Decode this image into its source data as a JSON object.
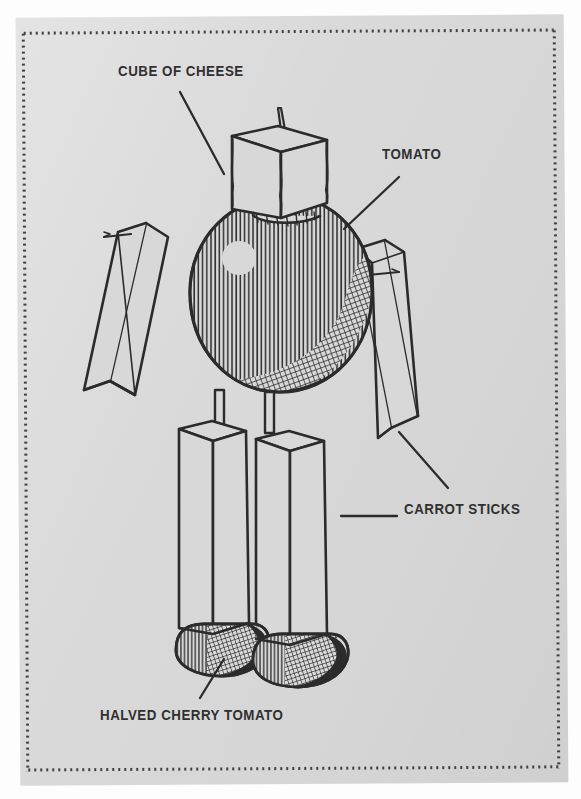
{
  "document": {
    "type": "illustrated-diagram",
    "title": "Veggie figure assembly diagram",
    "background_color": "#d8d8d8",
    "page_color": "#fdfdfd",
    "ink_color": "#2b2b2b",
    "border_style": "dotted"
  },
  "labels": [
    {
      "id": "cube-of-cheese",
      "text": "CUBE OF CHEESE",
      "x": 118,
      "y": 63,
      "align": "left"
    },
    {
      "id": "tomato",
      "text": "TOMATO",
      "x": 382,
      "y": 146,
      "align": "left"
    },
    {
      "id": "carrot-sticks",
      "text": "CARROT STICKS",
      "x": 404,
      "y": 501,
      "align": "left"
    },
    {
      "id": "halved-cherry-tomato",
      "text": "HALVED CHERRY TOMATO",
      "x": 100,
      "y": 707,
      "align": "left"
    }
  ],
  "leader_lines": [
    {
      "id": "leader-cheese",
      "from": [
        180,
        92
      ],
      "to": [
        224,
        174
      ]
    },
    {
      "id": "leader-tomato",
      "from": [
        399,
        177
      ],
      "to": [
        344,
        229
      ]
    },
    {
      "id": "leader-carrot-diagonal",
      "from": [
        399,
        432
      ],
      "to": [
        447,
        487
      ]
    },
    {
      "id": "leader-carrot-horizontal",
      "from": [
        341,
        515
      ],
      "to": [
        396,
        515
      ]
    },
    {
      "id": "leader-cherry",
      "from": [
        224,
        659
      ],
      "to": [
        200,
        698
      ]
    }
  ],
  "parts": [
    {
      "id": "head",
      "name": "cube of cheese",
      "shape": "cube",
      "note": "with toothpick spike on top"
    },
    {
      "id": "body",
      "name": "tomato",
      "shape": "sphere",
      "note": "cross-hatched shading, highlight dot upper-left"
    },
    {
      "id": "arm-left",
      "name": "carrot stick",
      "shape": "bar",
      "note": "pinned with toothpick"
    },
    {
      "id": "arm-right",
      "name": "carrot stick",
      "shape": "bar",
      "note": "pinned with toothpick"
    },
    {
      "id": "leg-left",
      "name": "carrot stick",
      "shape": "bar",
      "note": "attached by toothpick to body"
    },
    {
      "id": "leg-right",
      "name": "carrot stick",
      "shape": "bar",
      "note": "attached by toothpick to body"
    },
    {
      "id": "foot-left",
      "name": "halved cherry tomato",
      "shape": "dome",
      "note": "cut-side up under leg"
    },
    {
      "id": "foot-right",
      "name": "halved cherry tomato",
      "shape": "dome",
      "note": "cut-side up under leg"
    }
  ]
}
